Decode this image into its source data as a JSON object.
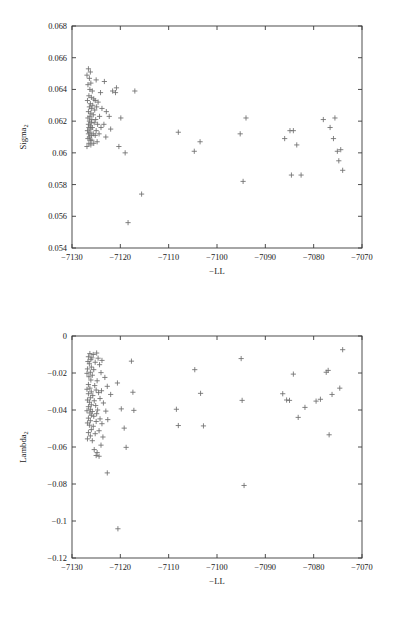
{
  "figure": {
    "background": "#ffffff",
    "marker_color": "#6e6e6e",
    "axis_color": "#3a3a3a",
    "text_color": "#1a1a1a"
  },
  "chart_data": [
    {
      "type": "scatter",
      "id": "sigma2-vs-negll",
      "title": "",
      "xlabel": "−LL",
      "ylabel_base": "Sigma",
      "ylabel_sub": "2",
      "ylabel": "Sigma2",
      "xlim": [
        -7130,
        -7070
      ],
      "ylim": [
        0.054,
        0.068
      ],
      "xticks": [
        -7130,
        -7120,
        -7110,
        -7100,
        -7090,
        -7080,
        -7070
      ],
      "xticklabels": [
        "−7130",
        "−7120",
        "−7110",
        "−7100",
        "−7090",
        "−7080",
        "−7070"
      ],
      "yticks": [
        0.054,
        0.056,
        0.058,
        0.06,
        0.062,
        0.064,
        0.066,
        0.068
      ],
      "yticklabels": [
        "0.054",
        "0.056",
        "0.058",
        "0.06",
        "0.062",
        "0.064",
        "0.066",
        "0.068"
      ],
      "grid": false,
      "legend": null,
      "marker": "plus",
      "points": [
        [
          -7126.6,
          0.0653
        ],
        [
          -7126.2,
          0.0651
        ],
        [
          -7126.9,
          0.0649
        ],
        [
          -7126.4,
          0.0647
        ],
        [
          -7126.1,
          0.0644
        ],
        [
          -7126.7,
          0.0643
        ],
        [
          -7125.0,
          0.0646
        ],
        [
          -7123.3,
          0.0645
        ],
        [
          -7126.3,
          0.064
        ],
        [
          -7125.8,
          0.0639
        ],
        [
          -7124.1,
          0.0638
        ],
        [
          -7121.6,
          0.0639
        ],
        [
          -7121.0,
          0.0638
        ],
        [
          -7120.8,
          0.0641
        ],
        [
          -7117.0,
          0.0639
        ],
        [
          -7126.5,
          0.0636
        ],
        [
          -7126.0,
          0.0635
        ],
        [
          -7125.5,
          0.0634
        ],
        [
          -7126.8,
          0.0633
        ],
        [
          -7125.2,
          0.0633
        ],
        [
          -7124.6,
          0.0632
        ],
        [
          -7126.2,
          0.0631
        ],
        [
          -7125.7,
          0.063
        ],
        [
          -7126.4,
          0.0629
        ],
        [
          -7124.9,
          0.0629
        ],
        [
          -7126.0,
          0.0628
        ],
        [
          -7125.3,
          0.0627
        ],
        [
          -7126.6,
          0.0626
        ],
        [
          -7123.8,
          0.0628
        ],
        [
          -7122.9,
          0.0626
        ],
        [
          -7126.1,
          0.0625
        ],
        [
          -7125.6,
          0.0624
        ],
        [
          -7126.3,
          0.0623
        ],
        [
          -7124.3,
          0.0623
        ],
        [
          -7122.3,
          0.0623
        ],
        [
          -7126.7,
          0.0622
        ],
        [
          -7125.9,
          0.0621
        ],
        [
          -7125.1,
          0.0621
        ],
        [
          -7126.4,
          0.062
        ],
        [
          -7119.9,
          0.0622
        ],
        [
          -7126.0,
          0.0619
        ],
        [
          -7125.4,
          0.0619
        ],
        [
          -7126.6,
          0.0618
        ],
        [
          -7124.7,
          0.0618
        ],
        [
          -7123.4,
          0.0618
        ],
        [
          -7126.2,
          0.0617
        ],
        [
          -7125.8,
          0.0616
        ],
        [
          -7126.5,
          0.0616
        ],
        [
          -7124.0,
          0.0616
        ],
        [
          -7126.1,
          0.0615
        ],
        [
          -7125.0,
          0.0614
        ],
        [
          -7126.8,
          0.0614
        ],
        [
          -7122.0,
          0.0615
        ],
        [
          -7126.3,
          0.0613
        ],
        [
          -7125.6,
          0.0612
        ],
        [
          -7126.6,
          0.0612
        ],
        [
          -7124.4,
          0.0612
        ],
        [
          -7126.0,
          0.0611
        ],
        [
          -7125.2,
          0.0611
        ],
        [
          -7126.4,
          0.061
        ],
        [
          -7123.0,
          0.061
        ],
        [
          -7126.7,
          0.0609
        ],
        [
          -7125.9,
          0.0608
        ],
        [
          -7126.2,
          0.0608
        ],
        [
          -7124.8,
          0.0607
        ],
        [
          -7126.5,
          0.0606
        ],
        [
          -7125.5,
          0.0606
        ],
        [
          -7126.1,
          0.0605
        ],
        [
          -7120.3,
          0.0604
        ],
        [
          -7126.9,
          0.0604
        ],
        [
          -7119.0,
          0.06
        ],
        [
          -7115.6,
          0.0574
        ],
        [
          -7118.4,
          0.0556
        ],
        [
          -7108.0,
          0.0613
        ],
        [
          -7103.5,
          0.0607
        ],
        [
          -7104.7,
          0.0601
        ],
        [
          -7094.0,
          0.0622
        ],
        [
          -7095.2,
          0.0612
        ],
        [
          -7094.6,
          0.0582
        ],
        [
          -7086.0,
          0.0609
        ],
        [
          -7084.9,
          0.0614
        ],
        [
          -7084.2,
          0.0614
        ],
        [
          -7083.5,
          0.0605
        ],
        [
          -7084.6,
          0.0586
        ],
        [
          -7082.6,
          0.0586
        ],
        [
          -7078.0,
          0.0621
        ],
        [
          -7075.6,
          0.0622
        ],
        [
          -7076.6,
          0.0616
        ],
        [
          -7075.9,
          0.0609
        ],
        [
          -7074.4,
          0.0602
        ],
        [
          -7075.1,
          0.0601
        ],
        [
          -7074.8,
          0.0595
        ],
        [
          -7074.0,
          0.0589
        ]
      ]
    },
    {
      "type": "scatter",
      "id": "lambda2-vs-negll",
      "title": "",
      "xlabel": "−LL",
      "ylabel_base": "Lambda",
      "ylabel_sub": "2",
      "ylabel": "Lambda2",
      "xlim": [
        -7130,
        -7070
      ],
      "ylim": [
        -0.12,
        0
      ],
      "xticks": [
        -7130,
        -7120,
        -7110,
        -7100,
        -7090,
        -7080,
        -7070
      ],
      "xticklabels": [
        "−7130",
        "−7120",
        "−7110",
        "−7100",
        "−7090",
        "−7080",
        "−7070"
      ],
      "yticks": [
        -0.12,
        -0.1,
        -0.08,
        -0.06,
        -0.04,
        -0.02,
        0
      ],
      "yticklabels": [
        "−0.12",
        "−0.1",
        "−0.08",
        "−0.06",
        "−0.04",
        "−0.02",
        "0"
      ],
      "grid": false,
      "legend": null,
      "marker": "plus",
      "points": [
        [
          -7126.3,
          -0.0095
        ],
        [
          -7125.6,
          -0.01
        ],
        [
          -7124.9,
          -0.0092
        ],
        [
          -7126.6,
          -0.0112
        ],
        [
          -7125.9,
          -0.0118
        ],
        [
          -7124.6,
          -0.012
        ],
        [
          -7126.1,
          -0.0128
        ],
        [
          -7123.8,
          -0.0132
        ],
        [
          -7126.7,
          -0.0138
        ],
        [
          -7125.2,
          -0.0142
        ],
        [
          -7117.7,
          -0.0136
        ],
        [
          -7126.4,
          -0.015
        ],
        [
          -7124.3,
          -0.0155
        ],
        [
          -7126.0,
          -0.0168
        ],
        [
          -7126.8,
          -0.0178
        ],
        [
          -7125.5,
          -0.0182
        ],
        [
          -7126.2,
          -0.0196
        ],
        [
          -7126.9,
          -0.0202
        ],
        [
          -7124.0,
          -0.0198
        ],
        [
          -7125.8,
          -0.0212
        ],
        [
          -7126.5,
          -0.022
        ],
        [
          -7123.2,
          -0.0224
        ],
        [
          -7126.1,
          -0.0238
        ],
        [
          -7124.8,
          -0.0242
        ],
        [
          -7120.6,
          -0.0254
        ],
        [
          -7126.6,
          -0.0262
        ],
        [
          -7125.3,
          -0.0268
        ],
        [
          -7122.7,
          -0.0272
        ],
        [
          -7126.3,
          -0.0282
        ],
        [
          -7126.9,
          -0.0288
        ],
        [
          -7125.0,
          -0.0292
        ],
        [
          -7123.9,
          -0.0296
        ],
        [
          -7126.0,
          -0.0302
        ],
        [
          -7124.5,
          -0.0306
        ],
        [
          -7117.4,
          -0.0304
        ],
        [
          -7126.6,
          -0.0312
        ],
        [
          -7122.0,
          -0.0316
        ],
        [
          -7125.7,
          -0.0322
        ],
        [
          -7126.2,
          -0.0334
        ],
        [
          -7124.2,
          -0.0338
        ],
        [
          -7126.8,
          -0.0346
        ],
        [
          -7125.4,
          -0.035
        ],
        [
          -7126.4,
          -0.0358
        ],
        [
          -7123.5,
          -0.0362
        ],
        [
          -7126.0,
          -0.0372
        ],
        [
          -7125.1,
          -0.0376
        ],
        [
          -7126.6,
          -0.0382
        ],
        [
          -7119.8,
          -0.0394
        ],
        [
          -7126.2,
          -0.0396
        ],
        [
          -7124.7,
          -0.04
        ],
        [
          -7126.9,
          -0.0404
        ],
        [
          -7125.8,
          -0.0408
        ],
        [
          -7123.0,
          -0.0406
        ],
        [
          -7117.2,
          -0.0402
        ],
        [
          -7126.3,
          -0.0416
        ],
        [
          -7124.9,
          -0.042
        ],
        [
          -7126.0,
          -0.0428
        ],
        [
          -7125.5,
          -0.0434
        ],
        [
          -7126.6,
          -0.0444
        ],
        [
          -7124.2,
          -0.0448
        ],
        [
          -7122.6,
          -0.0452
        ],
        [
          -7126.2,
          -0.0458
        ],
        [
          -7125.0,
          -0.0462
        ],
        [
          -7126.8,
          -0.047
        ],
        [
          -7123.8,
          -0.0474
        ],
        [
          -7126.4,
          -0.0482
        ],
        [
          -7125.6,
          -0.0488
        ],
        [
          -7119.2,
          -0.0498
        ],
        [
          -7126.0,
          -0.0506
        ],
        [
          -7124.4,
          -0.0512
        ],
        [
          -7126.6,
          -0.0522
        ],
        [
          -7125.2,
          -0.0528
        ],
        [
          -7126.2,
          -0.054
        ],
        [
          -7123.6,
          -0.0546
        ],
        [
          -7118.8,
          -0.0602
        ],
        [
          -7126.8,
          -0.0556
        ],
        [
          -7125.8,
          -0.0566
        ],
        [
          -7124.0,
          -0.059
        ],
        [
          -7125.4,
          -0.0614
        ],
        [
          -7124.8,
          -0.063
        ],
        [
          -7125.0,
          -0.0646
        ],
        [
          -7124.4,
          -0.065
        ],
        [
          -7122.7,
          -0.074
        ],
        [
          -7120.5,
          -0.1042
        ],
        [
          -7108.4,
          -0.0396
        ],
        [
          -7108.0,
          -0.0484
        ],
        [
          -7103.4,
          -0.031
        ],
        [
          -7104.6,
          -0.0182
        ],
        [
          -7102.8,
          -0.0486
        ],
        [
          -7095.0,
          -0.0122
        ],
        [
          -7094.4,
          -0.0808
        ],
        [
          -7094.8,
          -0.0348
        ],
        [
          -7086.4,
          -0.0312
        ],
        [
          -7085.6,
          -0.0346
        ],
        [
          -7085.0,
          -0.0348
        ],
        [
          -7084.2,
          -0.0206
        ],
        [
          -7083.2,
          -0.044
        ],
        [
          -7081.8,
          -0.0386
        ],
        [
          -7079.5,
          -0.0352
        ],
        [
          -7078.6,
          -0.0342
        ],
        [
          -7077.4,
          -0.0196
        ],
        [
          -7077.0,
          -0.0186
        ],
        [
          -7076.2,
          -0.0316
        ],
        [
          -7076.8,
          -0.0534
        ],
        [
          -7074.6,
          -0.0282
        ],
        [
          -7074.0,
          -0.0074
        ]
      ]
    }
  ]
}
